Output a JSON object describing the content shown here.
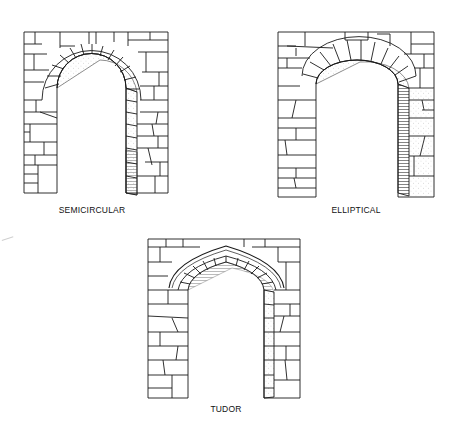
{
  "figure": {
    "arches": [
      {
        "id": "semicircular",
        "label": "SEMICIRCULAR"
      },
      {
        "id": "elliptical",
        "label": "ELLIPTICAL"
      },
      {
        "id": "tudor",
        "label": "TUDOR"
      }
    ]
  },
  "colors": {
    "ink": "#1a1a1a",
    "paper": "#ffffff",
    "stipple": "#9a9a9a"
  }
}
